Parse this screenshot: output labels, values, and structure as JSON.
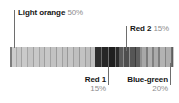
{
  "callouts": {
    "light_orange": {
      "name": "Light orange",
      "percent": "50%"
    },
    "red_2": {
      "name": "Red 2",
      "percent": "15%"
    },
    "red_1": {
      "name": "Red 1",
      "percent": "15%"
    },
    "blue_green": {
      "name": "Blue-green",
      "percent": "20%"
    }
  },
  "chart_data": {
    "type": "bar",
    "title": "",
    "subtitle": "",
    "xlabel": "",
    "ylabel": "",
    "grid": false,
    "legend_position": "callouts",
    "orientation": "horizontal-stacked-strip",
    "axis_range_percent": [
      0,
      100
    ],
    "categories": [
      "Light orange",
      "Red 1",
      "Red 2",
      "Blue-green"
    ],
    "values": [
      50,
      15,
      15,
      20
    ],
    "value_unit": "%",
    "annotations": [
      {
        "label": "Light orange",
        "value": "50%",
        "anchor": "strip-left",
        "position": "above-left"
      },
      {
        "label": "Red 2",
        "value": "15%",
        "anchor": "strip-mid-right",
        "position": "above-right"
      },
      {
        "label": "Red 1",
        "value": "15%",
        "anchor": "strip-mid",
        "position": "below"
      },
      {
        "label": "Blue-green",
        "value": "20%",
        "anchor": "strip-right",
        "position": "below-right"
      }
    ],
    "segments": [
      {
        "category": "Light orange",
        "width_pct": 1.2,
        "shade": "#7d7d7d"
      },
      {
        "category": "Light orange",
        "width_pct": 2.4,
        "shade": "#cccccc"
      },
      {
        "category": "Light orange",
        "width_pct": 0.6,
        "shade": "#a8a8a8"
      },
      {
        "category": "Light orange",
        "width_pct": 3.0,
        "shade": "#c6c6c6"
      },
      {
        "category": "Light orange",
        "width_pct": 0.6,
        "shade": "#a2a2a2"
      },
      {
        "category": "Light orange",
        "width_pct": 3.0,
        "shade": "#cacaca"
      },
      {
        "category": "Light orange",
        "width_pct": 0.6,
        "shade": "#a6a6a6"
      },
      {
        "category": "Light orange",
        "width_pct": 3.0,
        "shade": "#c4c4c4"
      },
      {
        "category": "Light orange",
        "width_pct": 0.6,
        "shade": "#9f9f9f"
      },
      {
        "category": "Light orange",
        "width_pct": 3.0,
        "shade": "#c8c8c8"
      },
      {
        "category": "Light orange",
        "width_pct": 0.6,
        "shade": "#a4a4a4"
      },
      {
        "category": "Light orange",
        "width_pct": 3.0,
        "shade": "#c3c3c3"
      },
      {
        "category": "Light orange",
        "width_pct": 0.6,
        "shade": "#9d9d9d"
      },
      {
        "category": "Light orange",
        "width_pct": 3.0,
        "shade": "#c7c7c7"
      },
      {
        "category": "Light orange",
        "width_pct": 0.6,
        "shade": "#a2a2a2"
      },
      {
        "category": "Light orange",
        "width_pct": 3.0,
        "shade": "#c2c2c2"
      },
      {
        "category": "Light orange",
        "width_pct": 0.6,
        "shade": "#9b9b9b"
      },
      {
        "category": "Light orange",
        "width_pct": 3.0,
        "shade": "#c6c6c6"
      },
      {
        "category": "Light orange",
        "width_pct": 0.6,
        "shade": "#a0a0a0"
      },
      {
        "category": "Light orange",
        "width_pct": 3.0,
        "shade": "#c1c1c1"
      },
      {
        "category": "Light orange",
        "width_pct": 0.6,
        "shade": "#999999"
      },
      {
        "category": "Light orange",
        "width_pct": 3.0,
        "shade": "#c5c5c5"
      },
      {
        "category": "Light orange",
        "width_pct": 0.6,
        "shade": "#9e9e9e"
      },
      {
        "category": "Light orange",
        "width_pct": 3.0,
        "shade": "#bfbfbf"
      },
      {
        "category": "Light orange",
        "width_pct": 0.6,
        "shade": "#979797"
      },
      {
        "category": "Light orange",
        "width_pct": 3.0,
        "shade": "#c3c3c3"
      },
      {
        "category": "Light orange",
        "width_pct": 0.6,
        "shade": "#9c9c9c"
      },
      {
        "category": "Light orange",
        "width_pct": 3.0,
        "shade": "#bdbdbd"
      },
      {
        "category": "Light orange",
        "width_pct": 0.6,
        "shade": "#959595"
      },
      {
        "category": "Light orange",
        "width_pct": 2.4,
        "shade": "#c0c0c0"
      },
      {
        "category": "Red 1",
        "width_pct": 3.6,
        "shade": "#2e2e2e"
      },
      {
        "category": "Red 1",
        "width_pct": 0.8,
        "shade": "#6a6a6a"
      },
      {
        "category": "Red 1",
        "width_pct": 3.6,
        "shade": "#262626"
      },
      {
        "category": "Red 1",
        "width_pct": 0.8,
        "shade": "#6e6e6e"
      },
      {
        "category": "Red 1",
        "width_pct": 3.6,
        "shade": "#1f1f1f"
      },
      {
        "category": "Red 1",
        "width_pct": 0.8,
        "shade": "#707070"
      },
      {
        "category": "Red 1",
        "width_pct": 1.8,
        "shade": "#2a2a2a"
      },
      {
        "category": "Red 2",
        "width_pct": 2.4,
        "shade": "#5a5a5a"
      },
      {
        "category": "Red 2",
        "width_pct": 0.8,
        "shade": "#8c8c8c"
      },
      {
        "category": "Red 2",
        "width_pct": 3.0,
        "shade": "#4e4e4e"
      },
      {
        "category": "Red 2",
        "width_pct": 0.8,
        "shade": "#8f8f8f"
      },
      {
        "category": "Red 2",
        "width_pct": 3.0,
        "shade": "#565656"
      },
      {
        "category": "Red 2",
        "width_pct": 0.8,
        "shade": "#3a3a3a"
      },
      {
        "category": "Red 2",
        "width_pct": 2.6,
        "shade": "#5f5f5f"
      },
      {
        "category": "Red 2",
        "width_pct": 0.8,
        "shade": "#909090"
      },
      {
        "category": "Blue-green",
        "width_pct": 3.0,
        "shade": "#a8a8a8"
      },
      {
        "category": "Blue-green",
        "width_pct": 0.8,
        "shade": "#7c7c7c"
      },
      {
        "category": "Blue-green",
        "width_pct": 3.0,
        "shade": "#b0b0b0"
      },
      {
        "category": "Blue-green",
        "width_pct": 0.8,
        "shade": "#818181"
      },
      {
        "category": "Blue-green",
        "width_pct": 3.0,
        "shade": "#ababab"
      },
      {
        "category": "Blue-green",
        "width_pct": 0.8,
        "shade": "#7e7e7e"
      },
      {
        "category": "Blue-green",
        "width_pct": 3.0,
        "shade": "#b3b3b3"
      },
      {
        "category": "Blue-green",
        "width_pct": 0.8,
        "shade": "#848484"
      },
      {
        "category": "Blue-green",
        "width_pct": 3.0,
        "shade": "#aeaeae"
      },
      {
        "category": "Blue-green",
        "width_pct": 0.8,
        "shade": "#6d6d6d"
      },
      {
        "category": "Blue-green",
        "width_pct": 1.0,
        "shade": "#5e5e5e"
      }
    ]
  }
}
